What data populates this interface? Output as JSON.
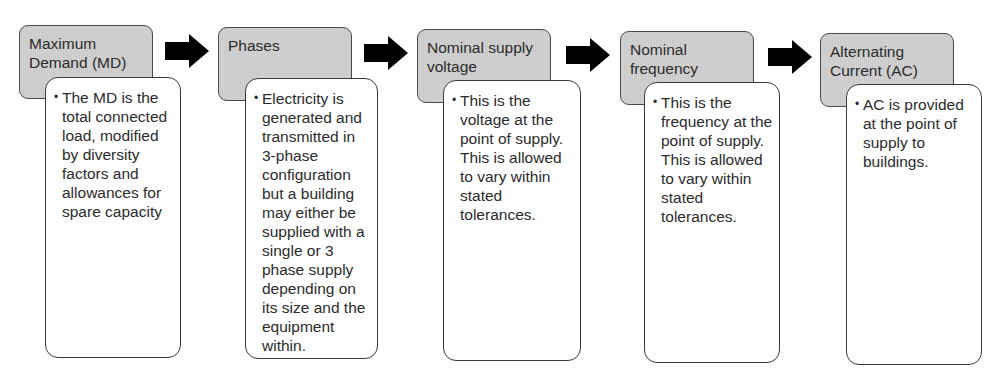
{
  "diagram": {
    "steps": [
      {
        "title": "Maximum Demand (MD)",
        "description": "The MD is the total connected load, modified by diversity factors and allowances for spare capacity"
      },
      {
        "title": "Phases",
        "description": "Electricity is generated and transmitted in 3-phase configuration but a building may either be supplied with a single or 3 phase supply depending on its size and the equipment within."
      },
      {
        "title": "Nominal supply voltage",
        "description": "This is the voltage at the point of supply. This is allowed to vary within stated tolerances."
      },
      {
        "title": "Nominal frequency",
        "description": "This is the frequency at the point of supply. This is allowed to vary within stated tolerances."
      },
      {
        "title": "Alternating Current (AC)",
        "description": "AC is provided at the point of supply to buildings."
      }
    ],
    "connector_icon": "right-arrow-icon",
    "bullet_glyph": "•",
    "colors": {
      "header_fill": "#c9c9c9",
      "border": "#3a3a3a",
      "arrow": "#000000"
    }
  }
}
